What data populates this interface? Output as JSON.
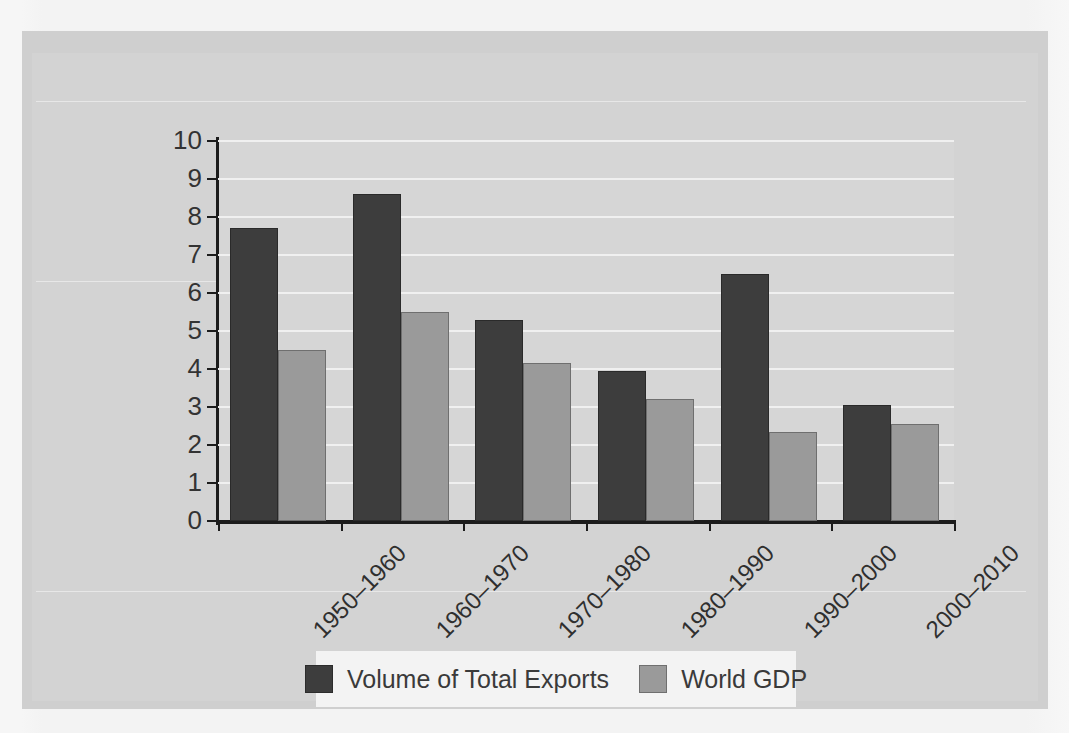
{
  "chart_data": {
    "type": "bar",
    "title": "",
    "subtitle": "",
    "xlabel": "",
    "ylabel": "",
    "categories": [
      "1950–1960",
      "1960–1970",
      "1970–1980",
      "1980–1990",
      "1990–2000",
      "2000–2010"
    ],
    "series": [
      {
        "name": "Volume of Total Exports",
        "color": "#3d3d3d",
        "values": [
          7.7,
          8.6,
          5.3,
          3.95,
          6.5,
          3.05
        ]
      },
      {
        "name": "World GDP",
        "color": "#9a9a9a",
        "values": [
          4.5,
          5.5,
          4.15,
          3.2,
          2.35,
          2.55
        ]
      }
    ],
    "ylim": [
      0,
      10
    ],
    "yticks": [
      "0",
      "1",
      "2",
      "3",
      "4",
      "5",
      "6",
      "7",
      "8",
      "9",
      "10"
    ],
    "grid": "horizontal",
    "legend_position": "bottom"
  },
  "legend": {
    "items": [
      {
        "label": "Volume of Total Exports",
        "swatch": "dark-swatch"
      },
      {
        "label": "World GDP",
        "swatch": "gray-swatch"
      }
    ]
  },
  "colors": {
    "series_dark": "#3d3d3d",
    "series_gray": "#9a9a9a",
    "plot_background": "#d6d6d6",
    "figure_background": "#cfcfcf",
    "gridline": "#f0f0f0",
    "axis": "#1c1c1c",
    "legend_background": "#f3f3f3"
  }
}
